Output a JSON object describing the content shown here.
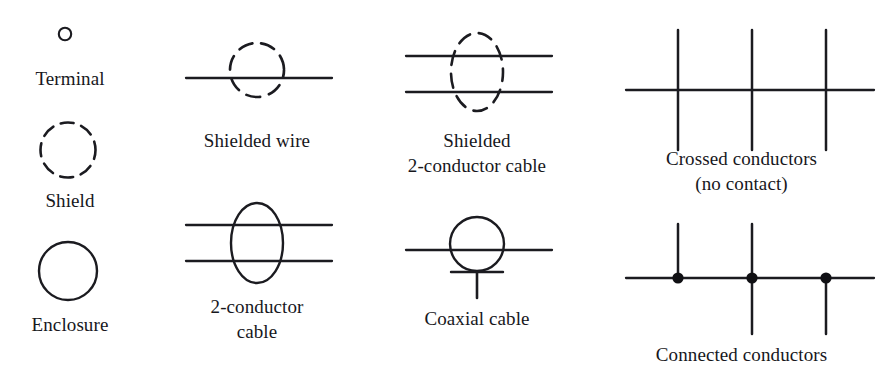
{
  "figure": {
    "kind": "electrical-schematic-symbol-legend",
    "background_color": "#ffffff",
    "ink_color": "#1b1b20",
    "columns": 4,
    "rows": 2
  },
  "symbols": [
    {
      "id": "terminal",
      "label": "Terminal",
      "kind": "open-circle",
      "description": "Small unfilled circle",
      "diameter_px": 13
    },
    {
      "id": "shield",
      "label": "Shield",
      "kind": "dashed-circle",
      "description": "Dashed circle outline",
      "diameter_px": 55
    },
    {
      "id": "enclosure",
      "label": "Enclosure",
      "kind": "solid-circle",
      "description": "Solid circle outline",
      "diameter_px": 58
    },
    {
      "id": "shielded-wire",
      "label": "Shielded wire",
      "kind": "line-through-dashed-circle",
      "description": "One horizontal conductor passing through a dashed circle",
      "conductors": 1
    },
    {
      "id": "two-conductor-cable",
      "label": "2-conductor\ncable",
      "label_lines": [
        "2-conductor",
        "cable"
      ],
      "kind": "two-lines-through-solid-ellipse",
      "description": "Two horizontal conductors passing through a solid vertical ellipse",
      "conductors": 2
    },
    {
      "id": "shielded-two-conductor-cable",
      "label": "Shielded\n2-conductor cable",
      "label_lines": [
        "Shielded",
        "2-conductor cable"
      ],
      "kind": "two-lines-through-dashed-ellipse",
      "description": "Two horizontal conductors passing through a dashed vertical ellipse",
      "conductors": 2
    },
    {
      "id": "coaxial-cable",
      "label": "Coaxial cable",
      "kind": "line-through-circle-with-ground-stub",
      "description": "Horizontal conductor through a circle, with a shield bar and a downward stub below",
      "conductors": 1
    },
    {
      "id": "crossed-conductors",
      "label": "Crossed conductors\n(no contact)",
      "label_lines": [
        "Crossed conductors",
        "(no contact)"
      ],
      "kind": "crossings-without-dots",
      "description": "One horizontal conductor crossed by three vertical conductors, no junction dots",
      "crossings": 3,
      "junction_dots": 0
    },
    {
      "id": "connected-conductors",
      "label": "Connected conductors",
      "kind": "junctions-with-dots",
      "description": "One horizontal conductor with three filled junction dots; branches go up, up-and-down, and down",
      "crossings": 3,
      "junction_dots": 3,
      "branches": [
        "up",
        "up-and-down",
        "down"
      ]
    }
  ]
}
